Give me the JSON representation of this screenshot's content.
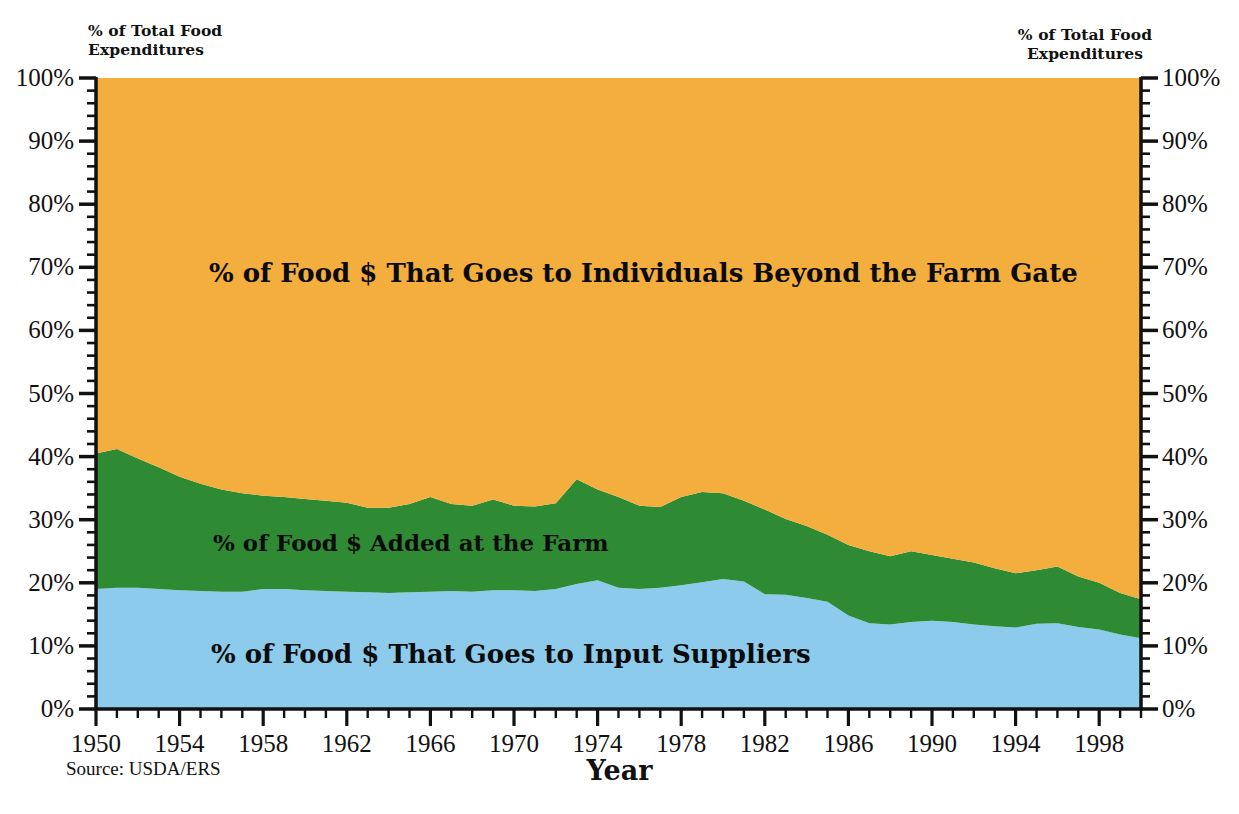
{
  "left_axis_caption": "% of Total Food\nExpenditures",
  "right_axis_caption": "% of Total Food\nExpenditures",
  "source_note": "Source: USDA/ERS",
  "x_axis_title": "Year",
  "area_labels": {
    "orange": "% of Food $ That Goes to Individuals Beyond the Farm Gate",
    "green": "% of Food $ Added at the Farm",
    "blue": "% of Food $ That Goes to Input Suppliers"
  },
  "colors": {
    "orange": "#F3AE3D",
    "green": "#2E8B33",
    "blue": "#8CCBEC",
    "axis": "#111111",
    "background": "#FFFFFF"
  },
  "chart_data": {
    "type": "area",
    "stacked": true,
    "title": "",
    "subtitle": "",
    "xlabel": "Year",
    "ylabel": "% of Total Food Expenditures",
    "xlim": [
      1950,
      2000
    ],
    "ylim": [
      0,
      100
    ],
    "grid": false,
    "legend_position": "inline-area-labels",
    "y_tick_labels": [
      "0%",
      "10%",
      "20%",
      "30%",
      "40%",
      "50%",
      "60%",
      "70%",
      "80%",
      "90%",
      "100%"
    ],
    "y_ticks": [
      0,
      10,
      20,
      30,
      40,
      50,
      60,
      70,
      80,
      90,
      100
    ],
    "y_minor_tick_step": 2,
    "x_tick_labels": [
      "1950",
      "1954",
      "1958",
      "1962",
      "1966",
      "1970",
      "1974",
      "1978",
      "1982",
      "1986",
      "1990",
      "1994",
      "1998"
    ],
    "x_ticks": [
      1950,
      1954,
      1958,
      1962,
      1966,
      1970,
      1974,
      1978,
      1982,
      1986,
      1990,
      1994,
      1998
    ],
    "x_minor_tick_step": 1,
    "x": [
      1950,
      1951,
      1952,
      1953,
      1954,
      1955,
      1956,
      1957,
      1958,
      1959,
      1960,
      1961,
      1962,
      1963,
      1964,
      1965,
      1966,
      1967,
      1968,
      1969,
      1970,
      1971,
      1972,
      1973,
      1974,
      1975,
      1976,
      1977,
      1978,
      1979,
      1980,
      1981,
      1982,
      1983,
      1984,
      1985,
      1986,
      1987,
      1988,
      1989,
      1990,
      1991,
      1992,
      1993,
      1994,
      1995,
      1996,
      1997,
      1998,
      1999,
      2000
    ],
    "series": [
      {
        "name": "% of Food $ That Goes to Input Suppliers",
        "color": "#8CCBEC",
        "values": [
          19.0,
          19.2,
          19.2,
          19.0,
          18.8,
          18.7,
          18.6,
          18.6,
          19.0,
          19.0,
          18.8,
          18.7,
          18.6,
          18.5,
          18.4,
          18.5,
          18.6,
          18.7,
          18.6,
          18.8,
          18.8,
          18.7,
          19.0,
          19.8,
          20.4,
          19.2,
          19.0,
          19.2,
          19.6,
          20.1,
          20.6,
          20.2,
          18.2,
          18.1,
          17.6,
          17.0,
          14.8,
          13.6,
          13.4,
          13.8,
          14.0,
          13.8,
          13.4,
          13.1,
          12.9,
          13.5,
          13.6,
          13.0,
          12.6,
          11.8,
          11.2
        ]
      },
      {
        "name": "% of Food $ Added at the Farm",
        "color": "#2E8B33",
        "values": [
          21.5,
          22.0,
          20.5,
          19.3,
          18.0,
          17.0,
          16.2,
          15.6,
          14.8,
          14.6,
          14.5,
          14.3,
          14.1,
          13.4,
          13.5,
          14.0,
          15.0,
          13.8,
          13.6,
          14.4,
          13.4,
          13.4,
          13.6,
          16.6,
          14.4,
          14.4,
          13.2,
          12.8,
          14.0,
          14.3,
          13.6,
          12.8,
          13.4,
          12.0,
          11.4,
          10.6,
          11.2,
          11.4,
          10.8,
          11.2,
          10.4,
          10.0,
          9.8,
          9.2,
          8.6,
          8.5,
          9.0,
          8.0,
          7.4,
          6.6,
          6.2
        ]
      },
      {
        "name": "% of Food $ That Goes to Individuals Beyond the Farm Gate",
        "color": "#F3AE3D",
        "values": [
          59.5,
          58.8,
          60.3,
          61.7,
          63.2,
          64.3,
          65.2,
          65.8,
          66.2,
          66.4,
          66.7,
          67.0,
          67.3,
          68.1,
          68.1,
          67.5,
          66.4,
          67.5,
          67.8,
          66.8,
          67.8,
          67.9,
          67.4,
          63.6,
          65.2,
          66.4,
          67.8,
          68.0,
          66.4,
          65.6,
          65.8,
          67.0,
          68.4,
          69.9,
          71.0,
          72.4,
          74.0,
          75.0,
          75.8,
          75.0,
          75.6,
          76.2,
          76.8,
          77.7,
          78.5,
          78.0,
          77.4,
          79.0,
          80.0,
          81.6,
          82.6
        ]
      }
    ]
  }
}
